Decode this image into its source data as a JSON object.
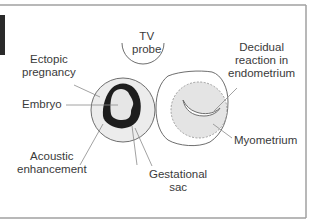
{
  "figure": {
    "labels": {
      "tv_probe": [
        "TV",
        "probe"
      ],
      "ectopic_pregnancy": [
        "Ectopic",
        "pregnancy"
      ],
      "embryo": "Embryo",
      "acoustic_enhancement": [
        "Acoustic",
        "enhancement"
      ],
      "gestational_sac": [
        "Gestational",
        "sac"
      ],
      "decidual_reaction": [
        "Decidual",
        "reaction in",
        "endometrium"
      ],
      "myometrium": "Myometrium"
    },
    "colors": {
      "outline": "#6e6e6e",
      "fill_light": "#ececec",
      "embryo_ring": "#1e1e1e",
      "text": "#3a3a3a",
      "frame": "#9a9a9a"
    }
  }
}
